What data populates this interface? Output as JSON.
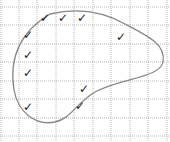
{
  "diagram": {
    "type": "grid-with-closed-curve",
    "grid": {
      "color": "#b5b5b5",
      "style": "dotted",
      "x_lines": [
        1,
        19,
        37,
        56,
        74,
        93,
        111,
        130,
        148,
        167
      ],
      "y_lines": [
        7,
        25,
        44,
        62,
        81,
        99,
        118,
        136
      ]
    },
    "curve": {
      "color": "#888888",
      "stroke_width": 1.3,
      "path": "M 50 14 C 75 8, 100 10, 125 24 C 150 37, 166 45, 163 62 C 160 78, 120 78, 95 92 C 75 104, 72 118, 55 122 C 35 126, 18 112, 14 90 C 10 65, 15 35, 50 14 Z"
    },
    "check_symbol": "✓",
    "checks": [
      {
        "x": 45,
        "y": 18
      },
      {
        "x": 63,
        "y": 18
      },
      {
        "x": 82,
        "y": 18
      },
      {
        "x": 28,
        "y": 35
      },
      {
        "x": 121,
        "y": 37
      },
      {
        "x": 28,
        "y": 55
      },
      {
        "x": 28,
        "y": 73
      },
      {
        "x": 84,
        "y": 89
      },
      {
        "x": 28,
        "y": 107
      },
      {
        "x": 80,
        "y": 106
      }
    ]
  }
}
